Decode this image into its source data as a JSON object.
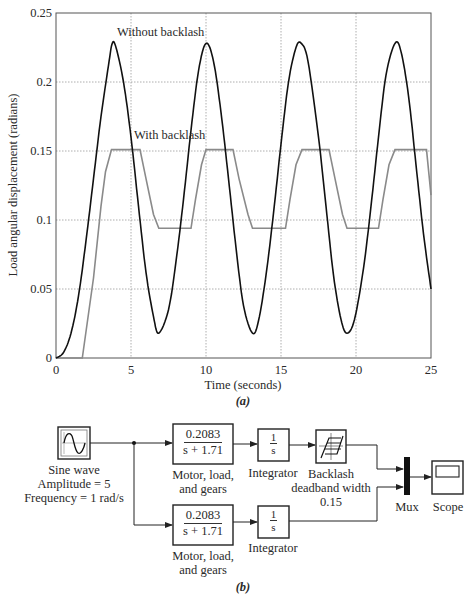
{
  "figure_a": {
    "caption": "(a)",
    "chart_data": {
      "type": "line",
      "title": "",
      "xlabel": "Time (seconds)",
      "ylabel": "Load angular displacement (radians)",
      "xlim": [
        0,
        25
      ],
      "ylim": [
        0,
        0.25
      ],
      "xticks": [
        "0",
        "5",
        "10",
        "15",
        "20",
        "25"
      ],
      "yticks": [
        "0",
        "0.05",
        "0.1",
        "0.15",
        "0.2",
        "0.25"
      ],
      "grid": true,
      "annotations": [
        {
          "text": "Without backlash",
          "x": 6.2,
          "y": 0.237
        },
        {
          "text": "With backlash",
          "x": 7.2,
          "y": 0.161
        }
      ],
      "series": [
        {
          "name": "Without backlash",
          "color": "#111111",
          "x": [
            0,
            0.5,
            1,
            1.5,
            2,
            2.5,
            3,
            3.5,
            3.75,
            4,
            4.5,
            5,
            5.5,
            6,
            6.5,
            6.85,
            7.5,
            8,
            8.5,
            9,
            9.5,
            10.0,
            10.5,
            11,
            11.5,
            12,
            12.5,
            13.1,
            13.5,
            14,
            14.5,
            15,
            15.5,
            16,
            16.35,
            16.8,
            17.5,
            18,
            18.5,
            19,
            19.4,
            19.9,
            20.5,
            21,
            21.5,
            22,
            22.6,
            23,
            23.5,
            24,
            24.5,
            25
          ],
          "y": [
            0,
            0.004,
            0.018,
            0.045,
            0.085,
            0.13,
            0.175,
            0.212,
            0.228,
            0.225,
            0.2,
            0.16,
            0.11,
            0.062,
            0.03,
            0.018,
            0.035,
            0.07,
            0.115,
            0.165,
            0.208,
            0.228,
            0.215,
            0.178,
            0.13,
            0.08,
            0.038,
            0.018,
            0.027,
            0.06,
            0.105,
            0.155,
            0.2,
            0.225,
            0.228,
            0.215,
            0.16,
            0.11,
            0.06,
            0.028,
            0.018,
            0.028,
            0.065,
            0.11,
            0.16,
            0.205,
            0.228,
            0.222,
            0.19,
            0.14,
            0.09,
            0.05
          ]
        },
        {
          "name": "With backlash",
          "color": "#8a8a8a",
          "x": [
            0,
            1.75,
            2.5,
            3.0,
            3.3,
            3.7,
            5.6,
            6.0,
            6.5,
            6.85,
            9.0,
            9.3,
            9.7,
            10.0,
            11.8,
            12.2,
            12.8,
            13.1,
            15.3,
            15.6,
            16.0,
            16.4,
            18.2,
            18.6,
            19.1,
            19.4,
            21.5,
            21.8,
            22.2,
            22.6,
            24.7,
            25.0
          ],
          "y": [
            0,
            0,
            0.058,
            0.11,
            0.135,
            0.151,
            0.151,
            0.13,
            0.104,
            0.094,
            0.094,
            0.115,
            0.14,
            0.151,
            0.151,
            0.13,
            0.104,
            0.094,
            0.094,
            0.115,
            0.14,
            0.151,
            0.151,
            0.13,
            0.104,
            0.094,
            0.094,
            0.115,
            0.14,
            0.151,
            0.151,
            0.118
          ]
        }
      ]
    }
  },
  "figure_b": {
    "caption": "(b)",
    "blocks": {
      "sine_wave": {
        "label_lines": [
          "Sine wave",
          "Amplitude = 5",
          "Frequency = 1 rad/s"
        ]
      },
      "tf_top": {
        "numerator": "0.2083",
        "denominator": "s + 1.71",
        "label_lines": [
          "Motor, load,",
          "and gears"
        ]
      },
      "tf_bottom": {
        "numerator": "0.2083",
        "denominator": "s + 1.71",
        "label_lines": [
          "Motor, load,",
          "and gears"
        ]
      },
      "integrator_top": {
        "numerator": "1",
        "denominator": "s",
        "label": "Integrator"
      },
      "integrator_bottom": {
        "numerator": "1",
        "denominator": "s",
        "label": "Integrator"
      },
      "backlash": {
        "label_lines": [
          "Backlash",
          "deadband width",
          "0.15"
        ]
      },
      "mux": {
        "label": "Mux"
      },
      "scope": {
        "label": "Scope"
      }
    }
  }
}
